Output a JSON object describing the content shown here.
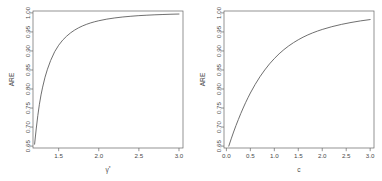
{
  "figure": {
    "name": "two-panel-ARE-figure",
    "background": "#ffffff",
    "line_color": "#555555",
    "axis_color": "#666666",
    "panels": 2
  },
  "chart_data": [
    {
      "type": "line",
      "panel": "left",
      "title": "",
      "xlabel": "γ*",
      "xlabel_base": "γ",
      "xlabel_sup": "*",
      "ylabel": "ARE",
      "xlim": [
        1.18,
        3.05
      ],
      "ylim": [
        0.645,
        1.005
      ],
      "xticks": [
        1.5,
        2.0,
        2.5,
        3.0
      ],
      "xticklabels": [
        "1.5",
        "2.0",
        "2.5",
        "3.0"
      ],
      "yticks": [
        0.65,
        0.7,
        0.75,
        0.8,
        0.85,
        0.9,
        0.95,
        1.0
      ],
      "yticklabels": [
        "0.65",
        "0.70",
        "0.75",
        "0.80",
        "0.85",
        "0.90",
        "0.95",
        "1.00"
      ],
      "grid": false,
      "legend": "none",
      "x": [
        1.2,
        1.22,
        1.24,
        1.26,
        1.28,
        1.3,
        1.33,
        1.36,
        1.4,
        1.45,
        1.5,
        1.55,
        1.6,
        1.65,
        1.7,
        1.75,
        1.8,
        1.85,
        1.9,
        1.95,
        2.0,
        2.1,
        2.2,
        2.3,
        2.4,
        2.5,
        2.6,
        2.7,
        2.8,
        2.9,
        3.0
      ],
      "y": [
        0.655,
        0.695,
        0.73,
        0.76,
        0.7845,
        0.805,
        0.831,
        0.852,
        0.875,
        0.898,
        0.915,
        0.9285,
        0.939,
        0.9478,
        0.955,
        0.961,
        0.966,
        0.9702,
        0.9738,
        0.9768,
        0.9794,
        0.9836,
        0.9868,
        0.9893,
        0.9912,
        0.9928,
        0.994,
        0.995,
        0.9958,
        0.9965,
        0.997
      ]
    },
    {
      "type": "line",
      "panel": "right",
      "title": "",
      "xlabel": "c",
      "ylabel": "ARE",
      "xlim": [
        -0.05,
        3.08
      ],
      "ylim": [
        0.645,
        1.005
      ],
      "xticks": [
        0.0,
        0.5,
        1.0,
        1.5,
        2.0,
        2.5,
        3.0
      ],
      "xticklabels": [
        "0.0",
        "0.5",
        "1.0",
        "1.5",
        "2.0",
        "2.5",
        "3.0"
      ],
      "yticks": [
        0.65,
        0.7,
        0.75,
        0.8,
        0.85,
        0.9,
        0.95,
        1.0
      ],
      "yticklabels": [
        "0.65",
        "0.70",
        "0.75",
        "0.80",
        "0.85",
        "0.90",
        "0.95",
        "1.00"
      ],
      "grid": false,
      "legend": "none",
      "x": [
        0.05,
        0.1,
        0.15,
        0.2,
        0.25,
        0.3,
        0.35,
        0.4,
        0.45,
        0.5,
        0.6,
        0.7,
        0.8,
        0.9,
        1.0,
        1.1,
        1.2,
        1.3,
        1.4,
        1.5,
        1.6,
        1.7,
        1.8,
        1.9,
        2.0,
        2.2,
        2.4,
        2.6,
        2.8,
        3.0
      ],
      "y": [
        0.65,
        0.669,
        0.687,
        0.704,
        0.72,
        0.7355,
        0.75,
        0.764,
        0.777,
        0.7895,
        0.812,
        0.8322,
        0.85,
        0.866,
        0.88,
        0.8925,
        0.9035,
        0.9132,
        0.9218,
        0.9294,
        0.9362,
        0.9422,
        0.9475,
        0.9522,
        0.9565,
        0.9638,
        0.9698,
        0.9748,
        0.979,
        0.9825
      ]
    }
  ]
}
